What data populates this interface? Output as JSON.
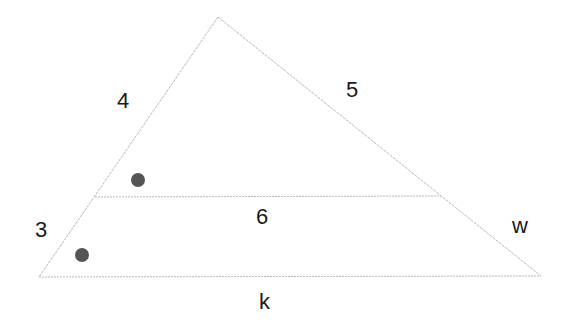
{
  "diagram": {
    "type": "similar-triangles",
    "vertices": {
      "apex": [
        218,
        17
      ],
      "bottom_left": [
        39,
        277
      ],
      "bottom_right": [
        541,
        276
      ]
    },
    "parallel_segment": {
      "start": [
        95,
        197
      ],
      "end": [
        441,
        196
      ]
    },
    "angle_markers": [
      [
        138,
        180
      ],
      [
        82,
        255
      ]
    ],
    "labels": {
      "left_upper": "4",
      "right_upper": "5",
      "left_lower": "3",
      "parallel": "6",
      "right_lower": "w",
      "base": "k"
    },
    "colors": {
      "line": "#b8b8b8",
      "dot": "#555555",
      "text": "#1a1a1a"
    }
  }
}
